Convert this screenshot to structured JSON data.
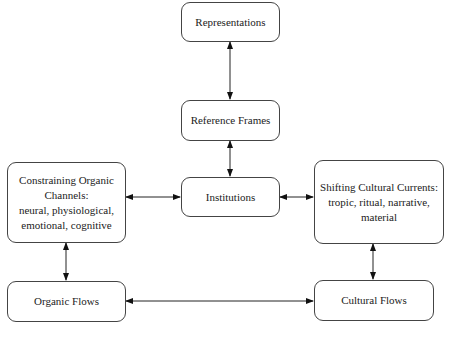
{
  "diagram": {
    "nodes": {
      "representations": "Representations",
      "reference_frames": "Reference Frames",
      "institutions": "Institutions",
      "constraining": {
        "line1": "Constraining Organic",
        "line2": "Channels:",
        "line3": "neural, physiological,",
        "line4": "emotional, cognitive"
      },
      "shifting": {
        "line1": "Shifting Cultural Currents:",
        "line2": "tropic, ritual, narrative,",
        "line3": "material"
      },
      "organic_flows": "Organic Flows",
      "cultural_flows": "Cultural Flows"
    },
    "edges": [
      {
        "from": "Representations",
        "to": "Reference Frames",
        "type": "bidirectional"
      },
      {
        "from": "Reference Frames",
        "to": "Institutions",
        "type": "bidirectional"
      },
      {
        "from": "Constraining Organic Channels",
        "to": "Institutions",
        "type": "bidirectional"
      },
      {
        "from": "Institutions",
        "to": "Shifting Cultural Currents",
        "type": "bidirectional"
      },
      {
        "from": "Constraining Organic Channels",
        "to": "Organic Flows",
        "type": "bidirectional"
      },
      {
        "from": "Shifting Cultural Currents",
        "to": "Cultural Flows",
        "type": "bidirectional"
      },
      {
        "from": "Organic Flows",
        "to": "Cultural Flows",
        "type": "bidirectional"
      }
    ]
  }
}
